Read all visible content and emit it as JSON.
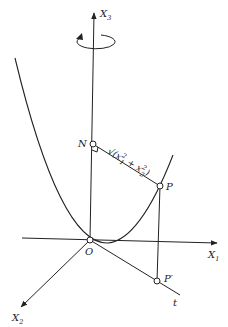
{
  "diagram": {
    "type": "geometric-3d-axes",
    "axes": {
      "x3": {
        "label": "X",
        "sub": "3"
      },
      "x1": {
        "label": "X",
        "sub": "1"
      },
      "x2": {
        "label": "X",
        "sub": "2"
      },
      "t": {
        "label": "t"
      }
    },
    "points": {
      "N": {
        "label": "N"
      },
      "P": {
        "label": "P"
      },
      "O": {
        "label": "O"
      },
      "P_prime": {
        "label": "P′"
      }
    },
    "distance_label": {
      "prefix": "√(x",
      "s1": "2",
      "sub1": "1",
      "mid": " + x",
      "s2": "2",
      "sub2": "2",
      "suffix": ")"
    },
    "rotation_symbol": "rotation-arrow",
    "curve": "parabola"
  }
}
